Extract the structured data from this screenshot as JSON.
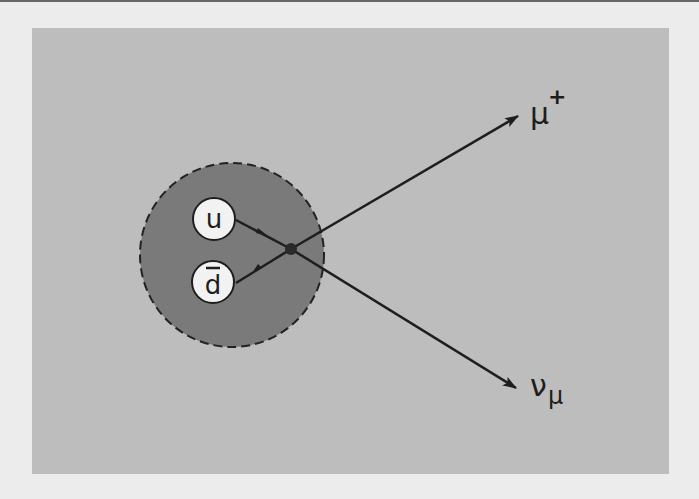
{
  "diagram": {
    "title": "",
    "hadron": {
      "quarks": [
        {
          "label": "u",
          "bar": false
        },
        {
          "label": "d",
          "bar": true
        }
      ]
    },
    "outgoing": [
      {
        "label": "μ",
        "superscript": "+"
      },
      {
        "label": "ν",
        "subscript": "μ"
      }
    ],
    "colors": {
      "background": "#ececec",
      "panel": "#bdbdbd",
      "hadron": "#7a7a7a",
      "quark_fill": "#f2f2f2",
      "line": "#1e1e1e"
    }
  }
}
